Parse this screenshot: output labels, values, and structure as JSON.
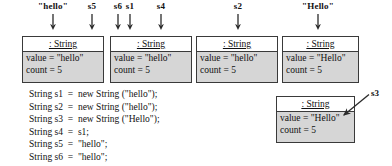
{
  "diagram": {
    "top_labels": [
      {
        "text": "\"hello\"",
        "x": 53
      },
      {
        "text": "s5",
        "x": 92
      },
      {
        "text": "s6",
        "x": 118
      },
      {
        "text": "s1",
        "x": 130
      },
      {
        "text": "s4",
        "x": 161
      },
      {
        "text": "s2",
        "x": 238
      },
      {
        "text": "\"Hello\"",
        "x": 318
      }
    ],
    "arrows": [
      {
        "name": "arrow-to-box1-hello",
        "x": 53,
        "top": 14,
        "height": 16
      },
      {
        "name": "arrow-to-box1-s5",
        "x": 92,
        "top": 14,
        "height": 16
      },
      {
        "name": "arrow-to-box1-s6",
        "x": 118,
        "top": 14,
        "height": 16
      },
      {
        "name": "arrow-to-box2-s1",
        "x": 130,
        "top": 14,
        "height": 16
      },
      {
        "name": "arrow-to-box2-s4",
        "x": 161,
        "top": 14,
        "height": 16
      },
      {
        "name": "arrow-to-box3-s2",
        "x": 238,
        "top": 14,
        "height": 16
      },
      {
        "name": "arrow-to-box4-hello",
        "x": 318,
        "top": 14,
        "height": 16
      }
    ],
    "objects": [
      {
        "id": "string-object-1",
        "header": ": String",
        "value": "value  =  \"hello\"",
        "count": "count  =  5",
        "x": 22,
        "y": 36,
        "width": 82,
        "height": 47
      },
      {
        "id": "string-object-2",
        "header": ": String",
        "value": "value  =  \"hello\"",
        "count": "count  =  5",
        "x": 110,
        "y": 36,
        "width": 82,
        "height": 47
      },
      {
        "id": "string-object-3",
        "header": ": String",
        "value": "value  =  \"hello\"",
        "count": "count  =  5",
        "x": 196,
        "y": 36,
        "width": 82,
        "height": 47
      },
      {
        "id": "string-object-4",
        "header": ": String",
        "value": "value  =  \"Hello\"",
        "count": "count  =  5",
        "x": 282,
        "y": 36,
        "width": 77,
        "height": 47
      },
      {
        "id": "string-object-s3",
        "header": ": String",
        "value": "value  =  \"Hello\"",
        "count": "count  =  5",
        "x": 276,
        "y": 96,
        "width": 79,
        "height": 47
      }
    ],
    "s3_callout": {
      "label": "s3",
      "label_x": 371,
      "label_y": 88
    },
    "code_lines": [
      "String s1  =  new String (\"hello\");",
      "String s2  =  new String (\"hello\");",
      "String s3  =  new String (\"Hello\");",
      "String s4  =  s1;",
      "String s5  =  \"hello\";",
      "String s6  =  \"hello\";"
    ]
  },
  "colors": {
    "background": "#ffffff",
    "box_fill": "#d6d6d6",
    "header_fill": "#ffffff",
    "stroke": "#3a3a3a",
    "text": "#111111"
  }
}
